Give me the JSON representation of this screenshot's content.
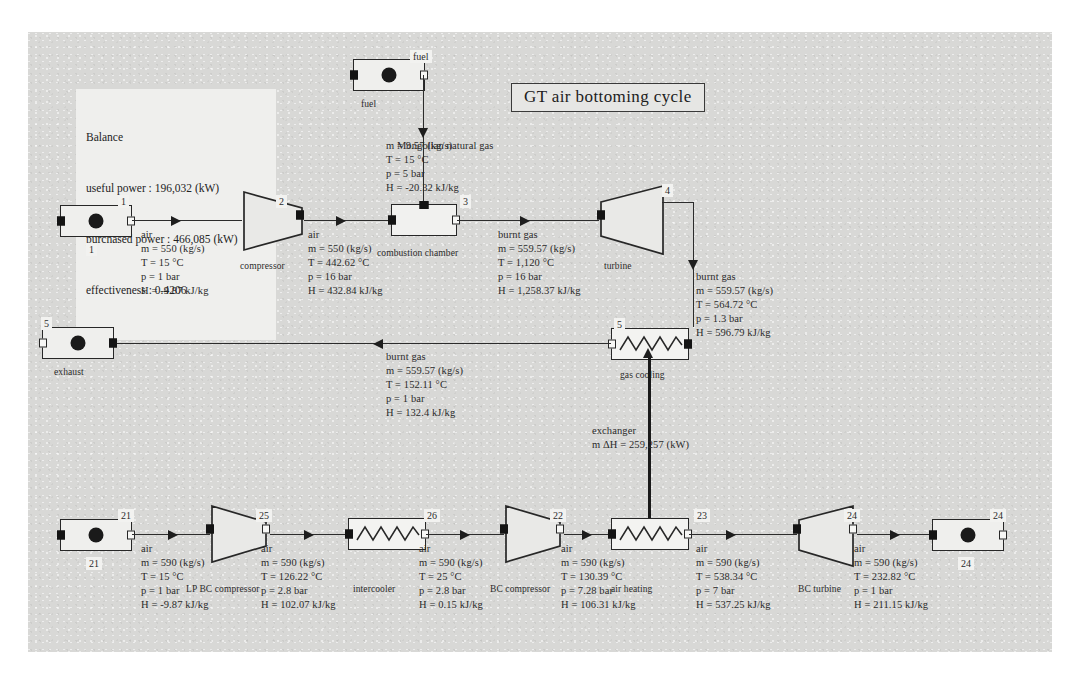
{
  "diagram": {
    "title": "GT air bottoming cycle",
    "balance": {
      "heading": "Balance",
      "useful_power": "useful power : 196,032 (kW)",
      "purchased_power": "purchased power : 466,085 (kW)",
      "effectiveness": "effectiveness : 0.4206"
    },
    "units": {
      "fuel_source": "fuel",
      "fuel_source_tag": "fuel",
      "compressor": "compressor",
      "combustion_chamber": "combustion chamber",
      "turbine": "turbine",
      "gas_cooling": "gas cooling",
      "exhaust": "exhaust",
      "exhaust_tag": "5",
      "air_source_tag": "1",
      "air_source_label": "1",
      "lp_bc_compressor": "LP BC compressor",
      "intercooler": "intercooler",
      "bc_compressor": "BC compressor",
      "air_heating": "air heating",
      "bc_turbine": "BC turbine",
      "bc_source_tag": "21",
      "bc_source_label": "21",
      "bc_sink_tag": "24",
      "bc_sink_label": "24"
    },
    "exchanger": {
      "label": "exchanger",
      "duty": "m ΔH = 259,257 (kW)"
    },
    "streams": [
      {
        "id": "1",
        "fluid": "air",
        "m": "m = 550 (kg/s)",
        "T": "T = 15 °C",
        "p": "p = 1 bar",
        "H": "H = -9.87 kJ/kg"
      },
      {
        "id": "2",
        "fluid": "air",
        "m": "m = 550 (kg/s)",
        "T": "T = 442.62 °C",
        "p": "p = 16 bar",
        "H": "H = 432.84 kJ/kg"
      },
      {
        "id": "3",
        "fluid": "burnt gas",
        "m": "m = 559.57 (kg/s)",
        "T": "T = 1,120 °C",
        "p": "p = 16 bar",
        "H": "H = 1,258.37 kJ/kg"
      },
      {
        "id": "4",
        "fluid": "burnt gas",
        "m": "m = 559.57 (kg/s)",
        "T": "T = 564.72 °C",
        "p": "p = 1.3 bar",
        "H": "H = 596.79 kJ/kg"
      },
      {
        "id": "5",
        "fluid": "burnt gas",
        "m": "m = 559.57 (kg/s)",
        "T": "T = 152.11 °C",
        "p": "p = 1 bar",
        "H": "H = 132.4 kJ/kg"
      },
      {
        "id": "fuel",
        "fluid": "Mongolian natural gas",
        "m": "m = 9.57 (kg/s)",
        "T": "T = 15 °C",
        "p": "p = 5 bar",
        "H": "H = -20.32 kJ/kg"
      },
      {
        "id": "21",
        "fluid": "air",
        "m": "m = 590 (kg/s)",
        "T": "T = 15 °C",
        "p": "p = 1 bar",
        "H": "H = -9.87 kJ/kg"
      },
      {
        "id": "25",
        "fluid": "air",
        "m": "m = 590 (kg/s)",
        "T": "T = 126.22 °C",
        "p": "p = 2.8 bar",
        "H": "H = 102.07 kJ/kg"
      },
      {
        "id": "26",
        "fluid": "air",
        "m": "m = 590 (kg/s)",
        "T": "T = 25 °C",
        "p": "p = 2.8 bar",
        "H": "H = 0.15 kJ/kg"
      },
      {
        "id": "22",
        "fluid": "air",
        "m": "m = 590 (kg/s)",
        "T": "T = 130.39 °C",
        "p": "p = 7.28 bar",
        "H": "H = 106.31 kJ/kg"
      },
      {
        "id": "23",
        "fluid": "air",
        "m": "m = 590 (kg/s)",
        "T": "T = 538.34 °C",
        "p": "p = 7 bar",
        "H": "H = 537.25 kJ/kg"
      },
      {
        "id": "24",
        "fluid": "air",
        "m": "m = 590 (kg/s)",
        "T": "T = 232.82 °C",
        "p": "p = 1 bar",
        "H": "H = 211.15 kJ/kg"
      }
    ]
  }
}
